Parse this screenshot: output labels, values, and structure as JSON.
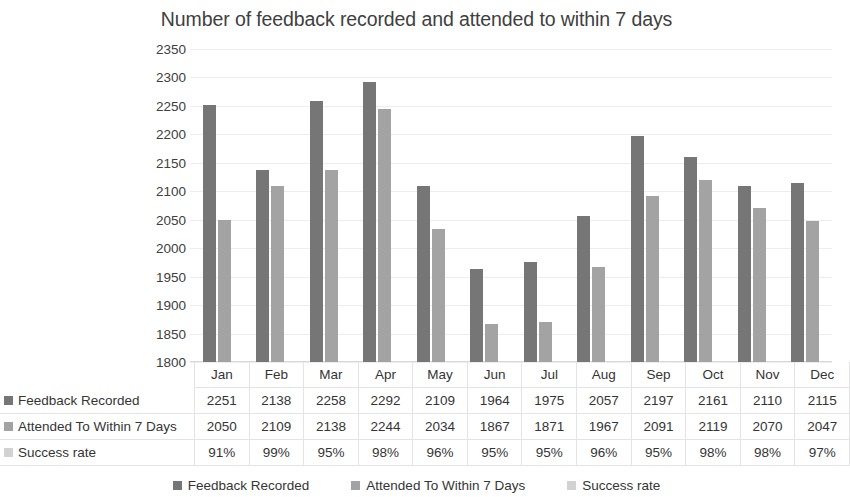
{
  "chart_data": {
    "type": "bar",
    "title": "Number of feedback recorded and attended to within 7 days",
    "xlabel": "",
    "ylabel": "",
    "ylim": [
      1800,
      2350
    ],
    "ytick_step": 50,
    "yticks": [
      "2350",
      "2300",
      "2250",
      "2200",
      "2150",
      "2100",
      "2050",
      "2000",
      "1950",
      "1900",
      "1850",
      "1800"
    ],
    "grid": true,
    "legend_position": "bottom",
    "categories": [
      "Jan",
      "Feb",
      "Mar",
      "Apr",
      "May",
      "Jun",
      "Jul",
      "Aug",
      "Sep",
      "Oct",
      "Nov",
      "Dec"
    ],
    "series": [
      {
        "name": "Feedback Recorded",
        "color": "#767676",
        "plotted": true,
        "values": [
          2251,
          2138,
          2258,
          2292,
          2109,
          1964,
          1975,
          2057,
          2197,
          2161,
          2110,
          2115
        ]
      },
      {
        "name": "Attended To Within 7 Days",
        "color": "#a3a3a3",
        "plotted": true,
        "values": [
          2050,
          2109,
          2138,
          2244,
          2034,
          1867,
          1871,
          1967,
          2091,
          2119,
          2070,
          2047
        ]
      },
      {
        "name": "Success rate",
        "color": "#d2d2d2",
        "plotted": false,
        "values": [
          "91%",
          "99%",
          "95%",
          "98%",
          "96%",
          "95%",
          "95%",
          "96%",
          "95%",
          "98%",
          "98%",
          "97%"
        ]
      }
    ]
  },
  "data_table": {
    "month_header": [
      "Jan",
      "Feb",
      "Mar",
      "Apr",
      "May",
      "Jun",
      "Jul",
      "Aug",
      "Sep",
      "Oct",
      "Nov",
      "Dec"
    ],
    "rows": [
      {
        "label": "Feedback Recorded",
        "cells": [
          "2251",
          "2138",
          "2258",
          "2292",
          "2109",
          "1964",
          "1975",
          "2057",
          "2197",
          "2161",
          "2110",
          "2115"
        ]
      },
      {
        "label": "Attended To Within 7 Days",
        "cells": [
          "2050",
          "2109",
          "2138",
          "2244",
          "2034",
          "1867",
          "1871",
          "1967",
          "2091",
          "2119",
          "2070",
          "2047"
        ]
      },
      {
        "label": "Success rate",
        "cells": [
          "91%",
          "99%",
          "95%",
          "98%",
          "96%",
          "95%",
          "95%",
          "96%",
          "95%",
          "98%",
          "98%",
          "97%"
        ]
      }
    ]
  },
  "legend": {
    "items": [
      {
        "label": "Feedback Recorded"
      },
      {
        "label": "Attended To Within 7 Days"
      },
      {
        "label": "Success rate"
      }
    ]
  }
}
